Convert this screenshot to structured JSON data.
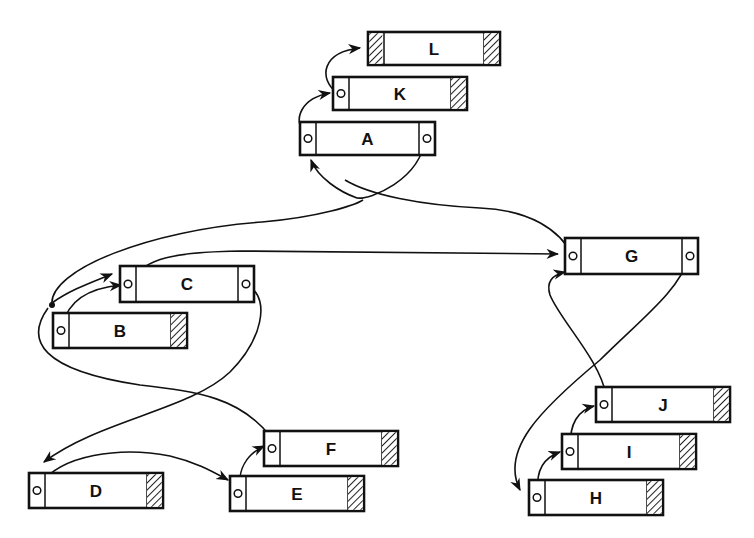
{
  "diagram": {
    "type": "linked-record-structure",
    "hatch_color": "#222222",
    "line_color": "#111111",
    "nodes": [
      {
        "id": "L",
        "label": "L",
        "x": 368,
        "y": 32,
        "w": 132,
        "h": 33,
        "left": "hatched",
        "right": "hatched"
      },
      {
        "id": "K",
        "label": "K",
        "x": 333,
        "y": 77,
        "w": 134,
        "h": 33,
        "left": "pointer",
        "right": "hatched"
      },
      {
        "id": "A",
        "label": "A",
        "x": 300,
        "y": 122,
        "w": 135,
        "h": 33,
        "left": "pointer",
        "right": "pointer"
      },
      {
        "id": "C",
        "label": "C",
        "x": 120,
        "y": 266,
        "w": 134,
        "h": 36,
        "left": "pointer",
        "right": "pointer"
      },
      {
        "id": "B",
        "label": "B",
        "x": 53,
        "y": 313,
        "w": 134,
        "h": 35,
        "left": "pointer",
        "right": "hatched"
      },
      {
        "id": "G",
        "label": "G",
        "x": 565,
        "y": 238,
        "w": 133,
        "h": 36,
        "left": "pointer",
        "right": "pointer"
      },
      {
        "id": "J",
        "label": "J",
        "x": 596,
        "y": 387,
        "w": 134,
        "h": 35,
        "left": "pointer",
        "right": "hatched"
      },
      {
        "id": "I",
        "label": "I",
        "x": 562,
        "y": 434,
        "w": 134,
        "h": 35,
        "left": "pointer",
        "right": "hatched"
      },
      {
        "id": "H",
        "label": "H",
        "x": 529,
        "y": 480,
        "w": 134,
        "h": 35,
        "left": "pointer",
        "right": "hatched"
      },
      {
        "id": "F",
        "label": "F",
        "x": 264,
        "y": 431,
        "w": 134,
        "h": 35,
        "left": "pointer",
        "right": "hatched"
      },
      {
        "id": "E",
        "label": "E",
        "x": 230,
        "y": 476,
        "w": 134,
        "h": 35,
        "left": "pointer",
        "right": "hatched"
      },
      {
        "id": "D",
        "label": "D",
        "x": 29,
        "y": 473,
        "w": 134,
        "h": 35,
        "left": "pointer",
        "right": "hatched"
      }
    ],
    "edges": [
      {
        "from": "K.left",
        "to": "L",
        "d": "M337,93 C318,78 322,52 360,48",
        "arrow": true
      },
      {
        "from": "A.left",
        "to": "K",
        "d": "M305,135 C292,118 302,98 330,93",
        "arrow": true
      },
      {
        "from": "A.right",
        "to": "A.left",
        "d": "M425,139 C420,180 370,200 357,198 C340,192 318,178 311,160",
        "arrow": true
      },
      {
        "from": "G.left",
        "to": "A",
        "d": "M573,256 C560,230 530,210 480,208 C420,205 370,195 345,180",
        "arrow": false
      },
      {
        "from": "loop",
        "to": "C",
        "d": "M52,305 C48,270 150,230 262,222 C320,217 355,205 363,200",
        "arrow": false
      },
      {
        "from": "B.junction",
        "to": "C.left",
        "d": "M52,303 C70,290 90,283 112,274",
        "arrow": true
      },
      {
        "from": "B.left",
        "to": "C.left",
        "d": "M63,325 C68,300 90,288 121,285",
        "arrow": true
      },
      {
        "from": "C.left",
        "to": "G.left",
        "d": "M130,281 C145,258 175,252 240,251 L558,254",
        "arrow": true
      },
      {
        "from": "B.loop",
        "to": "F.left",
        "d": "M48,308 C25,340 40,370 140,385 C200,392 240,398 270,436",
        "arrow": false
      },
      {
        "from": "C.right",
        "to": "D.left",
        "d": "M250,287 C270,300 262,340 230,372 C190,410 100,420 44,462",
        "arrow": true
      },
      {
        "from": "D.left",
        "to": "E.left",
        "d": "M40,485 C60,455 120,446 170,456 C195,462 210,470 228,480",
        "arrow": true
      },
      {
        "from": "E.left",
        "to": "F.left",
        "d": "M240,488 C238,470 246,455 264,446",
        "arrow": true
      },
      {
        "from": "G.right",
        "to": "H.left",
        "d": "M689,257 C680,290 640,320 600,360 C540,410 500,450 520,490",
        "arrow": true
      },
      {
        "from": "J.left",
        "to": "G.left",
        "d": "M606,395 C600,360 560,320 550,295 C546,282 552,275 565,272",
        "arrow": true
      },
      {
        "from": "H.left",
        "to": "I.left",
        "d": "M538,490 C536,470 543,458 560,452",
        "arrow": true
      },
      {
        "from": "I.left",
        "to": "J.left",
        "d": "M571,445 C569,425 578,410 594,406",
        "arrow": true
      }
    ]
  }
}
